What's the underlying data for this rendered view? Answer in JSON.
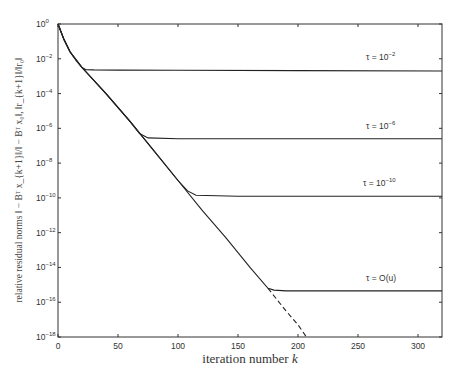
{
  "chart_data": {
    "type": "line",
    "title": "",
    "xlabel": "iteration number k",
    "ylabel": "relative residual norms ||−B^T x_{k+1}||/||−B^T x_0||, ||r_{k+1}||/||r_0||",
    "xlim": [
      0,
      320
    ],
    "ylim_log10": [
      -18,
      0
    ],
    "yscale": "log",
    "grid": false,
    "x_ticks": [
      0,
      50,
      100,
      150,
      200,
      250,
      300
    ],
    "y_ticks_exp": [
      0,
      -2,
      -4,
      -6,
      -8,
      -10,
      -12,
      -14,
      -16,
      -18
    ],
    "series": [
      {
        "name": "τ = 10^-2",
        "style": "solid",
        "x": [
          0,
          5,
          10,
          15,
          20,
          23,
          30,
          50,
          100,
          200,
          320
        ],
        "log10_y": [
          0,
          -0.9,
          -1.6,
          -2.1,
          -2.5,
          -2.62,
          -2.64,
          -2.65,
          -2.66,
          -2.68,
          -2.7
        ]
      },
      {
        "name": "τ = 10^-6",
        "style": "solid",
        "x": [
          0,
          5,
          10,
          20,
          40,
          60,
          68,
          75,
          100,
          200,
          320
        ],
        "log10_y": [
          0,
          -0.9,
          -1.6,
          -2.5,
          -4.0,
          -5.6,
          -6.3,
          -6.55,
          -6.6,
          -6.6,
          -6.6
        ]
      },
      {
        "name": "τ = 10^-10",
        "style": "solid",
        "x": [
          0,
          5,
          10,
          20,
          40,
          60,
          80,
          100,
          108,
          115,
          150,
          320
        ],
        "log10_y": [
          0,
          -0.9,
          -1.6,
          -2.5,
          -4.0,
          -5.6,
          -7.3,
          -9.0,
          -9.6,
          -9.85,
          -9.9,
          -9.9
        ]
      },
      {
        "name": "τ = O(u)",
        "style": "solid",
        "x": [
          0,
          5,
          10,
          20,
          40,
          60,
          80,
          100,
          120,
          140,
          160,
          175,
          180,
          190,
          320
        ],
        "log10_y": [
          0,
          -0.9,
          -1.6,
          -2.5,
          -4.0,
          -5.6,
          -7.3,
          -9.0,
          -10.7,
          -12.3,
          -14.0,
          -15.2,
          -15.3,
          -15.35,
          -15.35
        ]
      },
      {
        "name": "exact (no perturbation)",
        "style": "dashed",
        "x": [
          175,
          190,
          200,
          207
        ],
        "log10_y": [
          -15.2,
          -16.5,
          -17.3,
          -18
        ]
      }
    ],
    "annotations": [
      {
        "text": "τ = 10^-2",
        "x": 235,
        "log10_y": -2.1
      },
      {
        "text": "τ = 10^-6",
        "x": 235,
        "log10_y": -6.05
      },
      {
        "text": "τ = 10^-10",
        "x": 235,
        "log10_y": -9.35
      },
      {
        "text": "τ = O(u)",
        "x": 235,
        "log10_y": -14.7
      }
    ]
  },
  "axis": {
    "xlabel_text": "iteration number ",
    "xlabel_var": "k",
    "x_tick_labels": [
      "0",
      "50",
      "100",
      "150",
      "200",
      "250",
      "300"
    ],
    "y_tick_base": "10",
    "y_tick_exps": [
      "0",
      "−2",
      "−4",
      "−6",
      "−8",
      "−10",
      "−12",
      "−14",
      "−16",
      "−18"
    ],
    "ylabel_text": "relative residual norms ‖ − Bᵀ x_{k+1}‖/‖ − Bᵀ x₀‖, ‖r_{k+1}‖/‖r₀‖"
  },
  "annotations": {
    "a1_pre": "τ = 10",
    "a1_exp": "−2",
    "a2_pre": "τ = 10",
    "a2_exp": "−6",
    "a3_pre": "τ = 10",
    "a3_exp": "−10",
    "a4": "τ = O(u)"
  }
}
